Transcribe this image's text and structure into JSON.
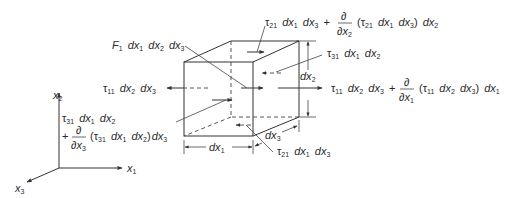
{
  "figure": {
    "type": "stress-element-free-body-diagram",
    "stroke_color": "#333333",
    "text_color": "#2a2a2a",
    "background": "#ffffff"
  },
  "labels": {
    "body_force": {
      "F": "F",
      "F_sub": "1",
      "d1": "dx",
      "d1_sub": "1",
      "d2": "dx",
      "d2_sub": "2",
      "d3": "dx",
      "d3_sub": "3"
    },
    "tau21_top": {
      "tau": "τ",
      "tau_sub": "21",
      "a": "dx",
      "a_sub": "1",
      "b": "dx",
      "b_sub": "3",
      "plus": "+",
      "partial_num": "∂",
      "partial_den": "∂x",
      "partial_den_sub": "2",
      "paren_open": "(τ",
      "paren_tau_sub": "21",
      "c": "dx",
      "c_sub": "1",
      "d": "dx",
      "d_sub": "3",
      "paren_close": ")",
      "e": "dx",
      "e_sub": "2"
    },
    "tau31_back": {
      "tau": "τ",
      "tau_sub": "31",
      "a": "dx",
      "a_sub": "1",
      "b": "dx",
      "b_sub": "2"
    },
    "tau11_left": {
      "tau": "τ",
      "tau_sub": "11",
      "a": "dx",
      "a_sub": "2",
      "b": "dx",
      "b_sub": "3"
    },
    "tau11_right": {
      "tau": "τ",
      "tau_sub": "11",
      "a": "dx",
      "a_sub": "2",
      "b": "dx",
      "b_sub": "3",
      "plus": "+",
      "partial_num": "∂",
      "partial_den": "∂x",
      "partial_den_sub": "1",
      "paren_open": "(τ",
      "paren_tau_sub": "11",
      "c": "dx",
      "c_sub": "2",
      "d": "dx",
      "d_sub": "3",
      "paren_close": ")",
      "e": "dx",
      "e_sub": "1"
    },
    "tau31_front": {
      "tau": "τ",
      "tau_sub": "31",
      "a": "dx",
      "a_sub": "1",
      "b": "dx",
      "b_sub": "2",
      "plus": "+",
      "partial_num": "∂",
      "partial_den": "∂x",
      "partial_den_sub": "3",
      "paren_open": "(τ",
      "paren_tau_sub": "31",
      "c": "dx",
      "c_sub": "1",
      "d": "dx",
      "d_sub": "2",
      "paren_close": ")",
      "e": "dx",
      "e_sub": "3"
    },
    "tau21_bottom": {
      "tau": "τ",
      "tau_sub": "21",
      "a": "dx",
      "a_sub": "1",
      "b": "dx",
      "b_sub": "3"
    },
    "dim_dx1": {
      "d": "dx",
      "sub": "1"
    },
    "dim_dx2": {
      "d": "dx",
      "sub": "2"
    },
    "dim_dx3": {
      "d": "dx",
      "sub": "3"
    },
    "axes": {
      "x1": "x",
      "x1_sub": "1",
      "x2": "x",
      "x2_sub": "2",
      "x3": "x",
      "x3_sub": "3"
    }
  }
}
